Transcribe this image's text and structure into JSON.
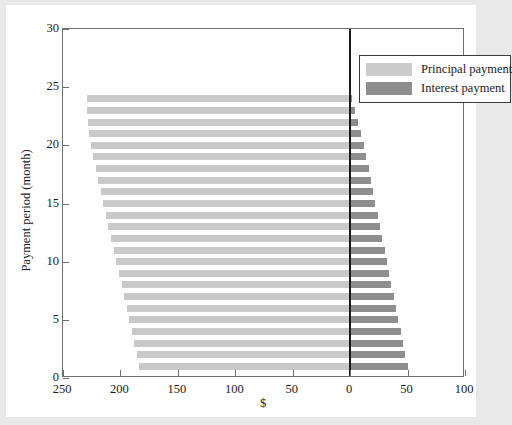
{
  "chart_data": {
    "type": "bar",
    "orientation": "horizontal",
    "title": "",
    "subtitle": "",
    "xlabel": "$",
    "ylabel": "Payment period (month)",
    "xlim": [
      250,
      100
    ],
    "ylim": [
      0,
      30
    ],
    "x_axis_direction": "reversed-left-to-zero",
    "xticks": [
      250,
      200,
      150,
      100,
      50,
      0,
      50,
      100
    ],
    "xtick_labels": [
      "250",
      "200",
      "150",
      "100",
      "50",
      "0",
      "50",
      "100"
    ],
    "xtick_values": [
      -250,
      -200,
      -150,
      -100,
      -50,
      0,
      50,
      100
    ],
    "yticks": [
      0,
      5,
      10,
      15,
      20,
      25,
      30
    ],
    "ytick_labels": [
      "0",
      "5",
      "10",
      "15",
      "20",
      "25",
      "30"
    ],
    "grid": false,
    "legend_position": "top-right",
    "colors": {
      "principal": "#c9c9c9",
      "interest": "#8e8e8e",
      "axis": "#6f6f6f",
      "zero_line": "#1a1a1a",
      "figure_background": "#ffffff",
      "page_background": "#e8e8e8"
    },
    "categories": [
      1,
      2,
      3,
      4,
      5,
      6,
      7,
      8,
      9,
      10,
      11,
      12,
      13,
      14,
      15,
      16,
      17,
      18,
      19,
      20,
      21,
      22,
      23,
      24
    ],
    "series": [
      {
        "name": "Principal payment",
        "color": "#c9c9c9",
        "direction": "negative",
        "values": [
          184.0,
          186.0,
          188.0,
          190.0,
          192.5,
          194.5,
          197.0,
          199.0,
          201.5,
          203.5,
          206.0,
          208.0,
          210.5,
          212.5,
          215.0,
          217.0,
          219.5,
          221.5,
          223.5,
          225.5,
          227.0,
          228.0,
          229.0,
          229.5
        ]
      },
      {
        "name": "Interest payment",
        "color": "#8e8e8e",
        "direction": "positive",
        "values": [
          50.0,
          48.0,
          46.0,
          44.0,
          42.0,
          40.0,
          38.0,
          36.0,
          34.0,
          32.0,
          30.0,
          28.0,
          26.0,
          24.0,
          22.0,
          20.0,
          18.0,
          16.0,
          14.0,
          12.0,
          9.5,
          7.0,
          4.5,
          1.5
        ]
      }
    ]
  },
  "legend": {
    "items": [
      {
        "label": "Principal payment",
        "key": "principal"
      },
      {
        "label": "Interest payment",
        "key": "interest"
      }
    ]
  }
}
